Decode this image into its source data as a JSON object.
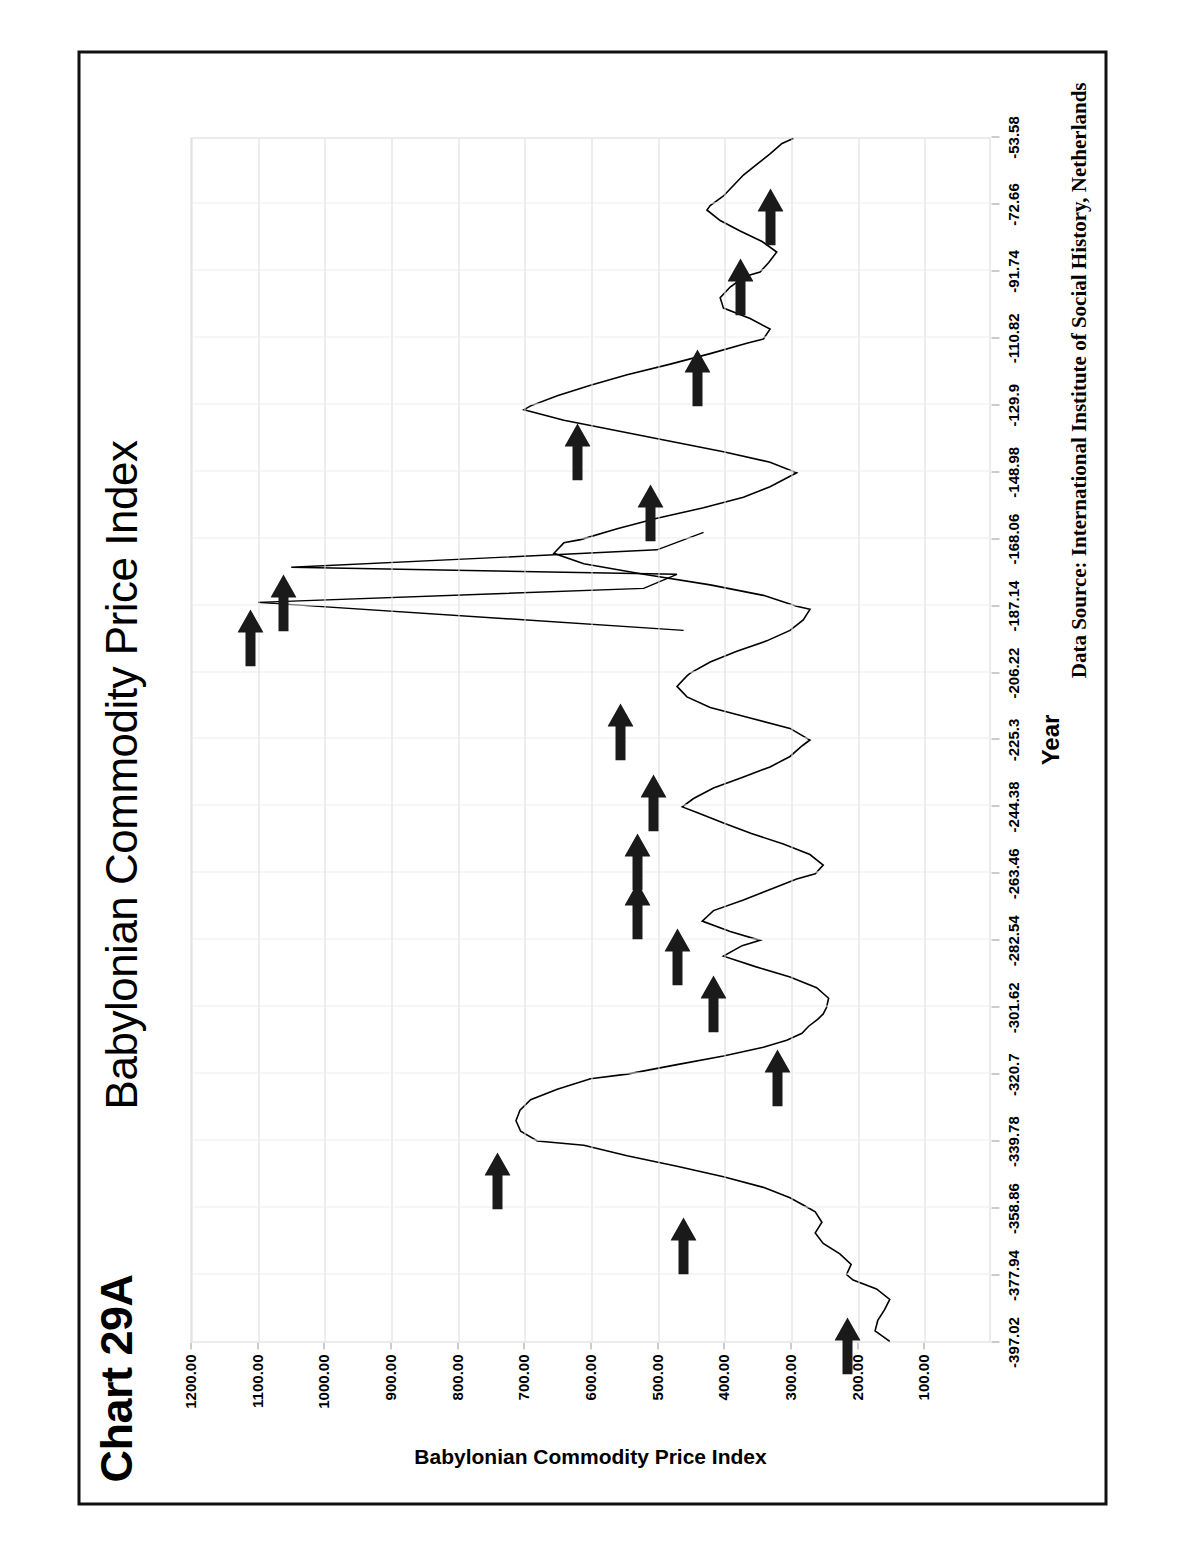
{
  "chart_number": "Chart 29A",
  "title": "Babylonian Commodity Price Index",
  "data_source": "Data Source:  International Institute of Social History, Netherlands",
  "axes": {
    "x_title": "Year",
    "y_title": "Babylonian Commodity Price Index"
  },
  "chart_data": {
    "type": "line",
    "title": "Babylonian Commodity Price Index",
    "xlabel": "Year",
    "ylabel": "Babylonian Commodity Price Index",
    "orientation": "rotated-90-ccw",
    "grid": true,
    "legend": "none",
    "line_color": "#000000",
    "ylim": [
      0,
      1200
    ],
    "yticks": [
      1200.0,
      1100.0,
      1000.0,
      900.0,
      800.0,
      700.0,
      600.0,
      500.0,
      400.0,
      300.0,
      200.0,
      100.0
    ],
    "ytick_labels": [
      "1200.00",
      "1100.00",
      "1000.00",
      "900.00",
      "800.00",
      "700.00",
      "600.00",
      "500.00",
      "400.00",
      "300.00",
      "200.00",
      "100.00"
    ],
    "xlim": [
      -397.02,
      -53.58
    ],
    "xticks": [
      -397.02,
      -377.94,
      -358.86,
      -339.78,
      -320.7,
      -301.62,
      -282.54,
      -263.46,
      -244.38,
      -225.3,
      -206.22,
      -187.14,
      -168.06,
      -148.98,
      -129.9,
      -110.82,
      -91.74,
      -72.66,
      -53.58
    ],
    "xtick_labels": [
      "-397.02",
      "-377.94",
      "-358.86",
      "-339.78",
      "-320.7",
      "-301.62",
      "-282.54",
      "-263.46",
      "-244.38",
      "-225.3",
      "-206.22",
      "-187.14",
      "-168.06",
      "-148.98",
      "-129.9",
      "-110.82",
      "-91.74",
      "-72.66",
      "-53.58"
    ],
    "x": [
      -397.0,
      -394.0,
      -391.0,
      -388.0,
      -385.0,
      -382.0,
      -379.5,
      -377.9,
      -375.0,
      -372.0,
      -369.0,
      -366.0,
      -363.0,
      -360.0,
      -358.9,
      -356.0,
      -353.0,
      -350.0,
      -347.0,
      -344.0,
      -341.0,
      -339.8,
      -337.0,
      -334.0,
      -331.0,
      -328.0,
      -325.0,
      -322.0,
      -320.7,
      -318.0,
      -315.5,
      -313.0,
      -311.0,
      -309.0,
      -307.0,
      -305.0,
      -303.5,
      -301.6,
      -299.0,
      -296.0,
      -293.0,
      -290.0,
      -287.0,
      -284.0,
      -282.5,
      -280.0,
      -277.0,
      -274.0,
      -271.0,
      -268.0,
      -265.0,
      -263.5,
      -261.0,
      -258.0,
      -255.0,
      -252.0,
      -249.0,
      -246.0,
      -244.4,
      -242.0,
      -239.0,
      -236.0,
      -233.0,
      -230.0,
      -227.0,
      -225.3,
      -222.0,
      -219.0,
      -216.0,
      -213.0,
      -210.0,
      -207.0,
      -206.2,
      -203.0,
      -200.0,
      -197.0,
      -194.0,
      -191.0,
      -188.0,
      -187.1,
      -184.0,
      -181.0,
      -178.0,
      -175.0,
      -172.0,
      -169.0,
      -168.1,
      -165.0,
      -162.0,
      -159.0,
      -156.0,
      -153.0,
      -150.0,
      -149.0,
      -146.0,
      -143.0,
      -140.0,
      -137.0,
      -134.0,
      -131.0,
      -129.9,
      -127.0,
      -124.0,
      -121.0,
      -118.0,
      -115.0,
      -112.0,
      -110.8,
      -108.0,
      -105.0,
      -102.0,
      -99.0,
      -96.0,
      -93.0,
      -91.7,
      -89.0,
      -86.0,
      -83.0,
      -80.0,
      -77.0,
      -74.0,
      -72.7,
      -70.0,
      -67.0,
      -64.0,
      -61.0,
      -58.0,
      -55.0,
      -53.6
    ],
    "values": [
      150,
      172,
      168,
      158,
      150,
      170,
      205,
      215,
      208,
      225,
      250,
      262,
      252,
      262,
      272,
      300,
      340,
      400,
      470,
      545,
      610,
      680,
      705,
      712,
      706,
      690,
      650,
      600,
      545,
      470,
      400,
      340,
      305,
      282,
      272,
      258,
      250,
      245,
      242,
      260,
      300,
      352,
      400,
      372,
      345,
      390,
      432,
      415,
      370,
      330,
      290,
      262,
      250,
      270,
      310,
      358,
      400,
      440,
      462,
      445,
      415,
      372,
      330,
      300,
      282,
      270,
      300,
      360,
      420,
      455,
      470,
      455,
      450,
      420,
      380,
      335,
      300,
      280,
      270,
      290,
      340,
      420,
      520,
      610,
      655,
      640,
      615,
      560,
      500,
      430,
      370,
      330,
      300,
      290,
      330,
      400,
      480,
      560,
      640,
      700,
      690,
      650,
      600,
      545,
      480,
      420,
      365,
      340,
      330,
      360,
      400,
      405,
      390,
      368,
      345,
      332,
      320,
      342,
      375,
      405,
      425,
      420,
      400,
      385,
      370,
      350,
      330,
      312,
      295
    ],
    "annotation_spikes": [
      {
        "x": -186.0,
        "value": 1100.0
      },
      {
        "x": -176.0,
        "value": 1050.0
      }
    ],
    "annotation_arrow_count": 16,
    "annotation_arrows": [
      {
        "x": -388.0,
        "value": 215
      },
      {
        "x": -359.5,
        "value": 460
      },
      {
        "x": -341.0,
        "value": 740
      },
      {
        "x": -311.5,
        "value": 320
      },
      {
        "x": -290.5,
        "value": 415
      },
      {
        "x": -277.0,
        "value": 470
      },
      {
        "x": -264.0,
        "value": 530
      },
      {
        "x": -250.0,
        "value": 530
      },
      {
        "x": -233.0,
        "value": 505
      },
      {
        "x": -213.0,
        "value": 555
      },
      {
        "x": -186.0,
        "value": 1110
      },
      {
        "x": -176.0,
        "value": 1060
      },
      {
        "x": -150.5,
        "value": 510
      },
      {
        "x": -133.0,
        "value": 620
      },
      {
        "x": -112.0,
        "value": 440
      },
      {
        "x": -86.0,
        "value": 375
      },
      {
        "x": -66.0,
        "value": 330
      }
    ],
    "note": "Line chart of an index of Babylonian commodity prices over time (years BCE shown as negative numbers). Black arrows mark successive price-inflation peaks."
  }
}
